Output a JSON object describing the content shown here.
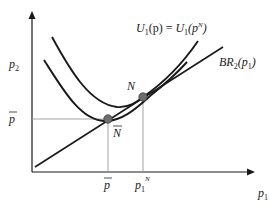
{
  "diagram": {
    "axes": {
      "x_label": "p",
      "x_label_sub": "1",
      "y_label": "p",
      "y_label_sub": "2"
    },
    "curves": {
      "indifference_label_lhs": "U",
      "indifference_label_lhs_sub": "1",
      "indifference_label_mid": "(p) = ",
      "indifference_label_rhs": "U",
      "indifference_label_rhs_sub": "1",
      "indifference_label_arg_open": "(p",
      "indifference_label_arg_sup": "N",
      "indifference_label_arg_close": ")",
      "best_response_label": "BR",
      "best_response_sub": "2",
      "best_response_arg_open": "(p",
      "best_response_arg_sub": "1",
      "best_response_arg_close": ")"
    },
    "points": {
      "nash": {
        "label": "N"
      },
      "collusive": {
        "label": "N"
      }
    },
    "ticks": {
      "y_pbar": "p",
      "x_pbar": "p",
      "x_p1N": "p",
      "x_p1N_sub": "1",
      "x_p1N_sup": "N"
    },
    "colors": {
      "curve": "#1a1a1a",
      "guide": "#9a9a9a",
      "point_fill": "#6e6e6e"
    }
  }
}
